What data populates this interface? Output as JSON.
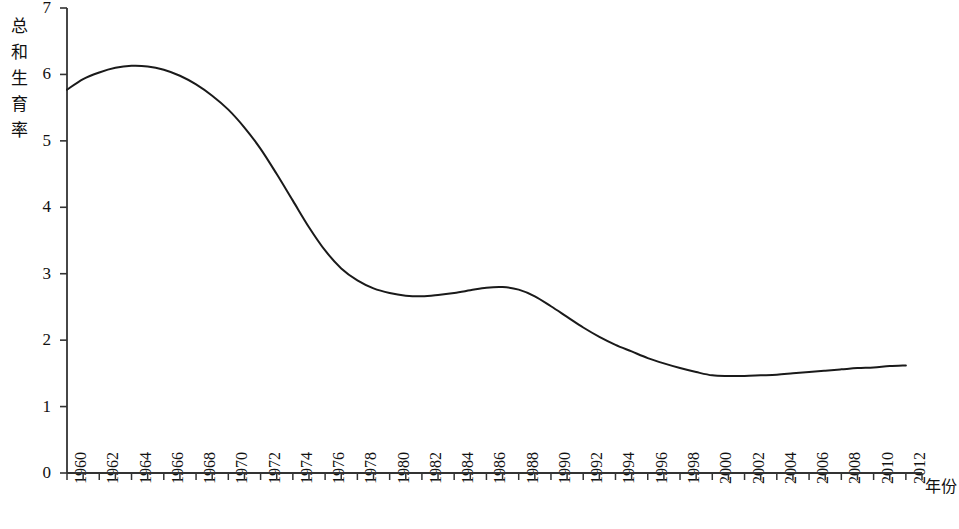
{
  "chart_data": {
    "type": "line",
    "title": "",
    "xlabel": "年份",
    "ylabel": "总和生育率",
    "ylabel_chars": [
      "总",
      "和",
      "生",
      "育",
      "率"
    ],
    "xlim": [
      1960,
      2013
    ],
    "ylim": [
      0,
      7
    ],
    "y_ticks": [
      0,
      1,
      2,
      3,
      4,
      5,
      6,
      7
    ],
    "y_tick_labels": [
      "0",
      "1",
      "2",
      "3",
      "4",
      "5",
      "6",
      "7"
    ],
    "x_tick_labels": [
      "1960",
      "1962",
      "1964",
      "1966",
      "1968",
      "1970",
      "1972",
      "1974",
      "1976",
      "1978",
      "1980",
      "1982",
      "1984",
      "1986",
      "1988",
      "1990",
      "1992",
      "1994",
      "1996",
      "1998",
      "2000",
      "2002",
      "2004",
      "2006",
      "2008",
      "2010",
      "2012"
    ],
    "x_minor_tick_interval": 1,
    "grid": false,
    "legend": false,
    "legend_position": "none",
    "line_color": "#1a1a1a",
    "line_width": 2,
    "axis_color": "#333333",
    "background": "#ffffff",
    "x": [
      1960,
      1961,
      1962,
      1963,
      1964,
      1965,
      1966,
      1967,
      1968,
      1969,
      1970,
      1971,
      1972,
      1973,
      1974,
      1975,
      1976,
      1977,
      1978,
      1979,
      1980,
      1981,
      1982,
      1983,
      1984,
      1985,
      1986,
      1987,
      1988,
      1989,
      1990,
      1991,
      1992,
      1993,
      1994,
      1995,
      1996,
      1997,
      1998,
      1999,
      2000,
      2001,
      2002,
      2003,
      2004,
      2005,
      2006,
      2007,
      2008,
      2009,
      2010,
      2011,
      2012
    ],
    "values": [
      5.77,
      5.93,
      6.03,
      6.1,
      6.13,
      6.12,
      6.07,
      5.98,
      5.85,
      5.68,
      5.47,
      5.2,
      4.88,
      4.5,
      4.1,
      3.7,
      3.35,
      3.08,
      2.9,
      2.78,
      2.71,
      2.67,
      2.66,
      2.68,
      2.71,
      2.75,
      2.79,
      2.8,
      2.76,
      2.66,
      2.51,
      2.35,
      2.19,
      2.05,
      1.93,
      1.83,
      1.73,
      1.65,
      1.58,
      1.52,
      1.47,
      1.46,
      1.46,
      1.47,
      1.48,
      1.5,
      1.52,
      1.54,
      1.56,
      1.58,
      1.59,
      1.61,
      1.62
    ],
    "annotations": []
  },
  "axes_geometry": {
    "origin_x": 67,
    "origin_y": 473,
    "top_y": 8,
    "right_x": 922,
    "px_per_year": 16.13,
    "px_per_unit": 66.43
  }
}
